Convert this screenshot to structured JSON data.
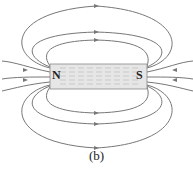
{
  "diagram": {
    "type": "bar-magnet-field-lines",
    "magnet": {
      "north_label": "N",
      "south_label": "S"
    },
    "caption": "(b)",
    "colors": {
      "field_line": "#777777",
      "magnet_fill": "#e6e6e6",
      "magnet_stroke": "#888888"
    }
  }
}
